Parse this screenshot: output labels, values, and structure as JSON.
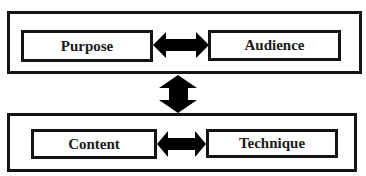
{
  "diagram": {
    "top_group": {
      "left_box": {
        "label": "Purpose"
      },
      "right_box": {
        "label": "Audience"
      }
    },
    "bottom_group": {
      "left_box": {
        "label": "Content"
      },
      "right_box": {
        "label": "Technique"
      }
    },
    "connectors": [
      {
        "from": "Purpose",
        "to": "Audience",
        "type": "double-arrow",
        "orientation": "horizontal"
      },
      {
        "from": "top_group",
        "to": "bottom_group",
        "type": "double-arrow",
        "orientation": "vertical"
      },
      {
        "from": "Content",
        "to": "Technique",
        "type": "double-arrow",
        "orientation": "horizontal"
      }
    ],
    "colors": {
      "stroke": "#141414",
      "fill": "#000000",
      "background": "#ffffff"
    }
  }
}
